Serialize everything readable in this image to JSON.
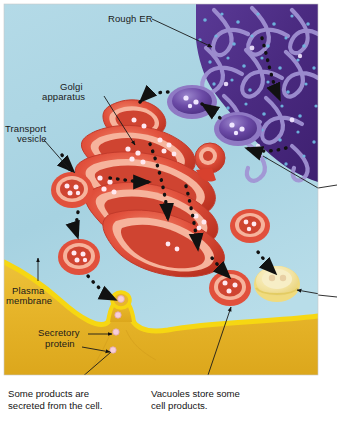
{
  "figure": {
    "canvas": {
      "width": 337,
      "height": 421
    },
    "art_frame": {
      "x": 4,
      "y": 4,
      "width": 314,
      "height": 371
    },
    "background_color": "#ffffff"
  },
  "palette": {
    "cytoplasm": "#a9d4e2",
    "cytoplasm_light": "#bcdeea",
    "rough_er_dark": "#4b2a82",
    "rough_er_mid": "#5d3a97",
    "rough_er_lumen": "#9f8fd0",
    "ribosome_dot": "#6fb7e0",
    "golgi_red": "#e1503c",
    "golgi_red_dark": "#c13a2b",
    "golgi_lumen": "#f6b39c",
    "vesicle_purple": "#6b4aa6",
    "vesicle_purple_rim": "#8f79c4",
    "vacuole_yellow": "#f2e2a0",
    "vacuole_rim": "#f6e27a",
    "membrane_line": "#f6d712",
    "cell_exterior": "#e8b62c",
    "cargo_dot": "#ffe6ef",
    "arrow_black": "#111111",
    "leader_line": "#1a1a1a",
    "label_text": "#1a1a1a"
  },
  "labels": [
    {
      "id": "rough-er",
      "text": "Rough ER",
      "x": 108,
      "y": 14,
      "align": "left"
    },
    {
      "id": "golgi-apparatus",
      "text": "Golgi",
      "x": 60,
      "y": 82,
      "align": "left"
    },
    {
      "id": "golgi-apparatus-2",
      "text": "apparatus",
      "x": 42,
      "y": 92,
      "align": "left"
    },
    {
      "id": "transport-vesicle",
      "text": "Transport",
      "x": 5,
      "y": 124,
      "align": "left"
    },
    {
      "id": "transport-vesicle-2",
      "text": "vesicle",
      "x": 17,
      "y": 134,
      "align": "left"
    },
    {
      "id": "plasma-membrane",
      "text": "Plasma",
      "x": 12,
      "y": 286,
      "align": "left"
    },
    {
      "id": "plasma-membrane-2",
      "text": "membrane",
      "x": 6,
      "y": 296,
      "align": "left"
    },
    {
      "id": "secretory-protein",
      "text": "Secretory",
      "x": 38,
      "y": 331,
      "align": "left"
    },
    {
      "id": "secretory-protein-2",
      "text": "protein",
      "x": 45,
      "y": 341,
      "align": "left"
    }
  ],
  "captions": [
    {
      "id": "caption-secretion",
      "line1": "Some products are",
      "line2": "secreted from the cell.",
      "x": 8,
      "y": 390
    },
    {
      "id": "caption-vacuoles",
      "line1": "Vacuoles store some",
      "line2": "cell products.",
      "x": 151,
      "y": 390
    }
  ],
  "structures": {
    "rough_er": {
      "name": "Rough ER",
      "region": "top-right",
      "ribosomes_visible": true
    },
    "golgi": {
      "name": "Golgi apparatus",
      "cisternae_count": 5,
      "region": "center-left"
    },
    "plasma_membrane": {
      "name": "Plasma membrane",
      "region": "bottom",
      "exocytosis_site_x": 123,
      "exocytosis_site_y": 318
    },
    "vacuole": {
      "name": "Vacuole",
      "color": "#f2e2a0",
      "x": 277,
      "y": 283
    },
    "secretory_vesicle": {
      "name": "Secretory vesicle",
      "color": "#e1503c",
      "x": 230,
      "y": 288
    }
  },
  "vesicles": [
    {
      "id": "er-vesicle-1",
      "type": "transport",
      "color": "purple",
      "cx": 192,
      "cy": 102,
      "rx": 25,
      "ry": 16,
      "cargo": 3
    },
    {
      "id": "er-vesicle-2",
      "type": "transport",
      "color": "purple",
      "cx": 238,
      "cy": 129,
      "rx": 24,
      "ry": 16,
      "cargo": 3
    },
    {
      "id": "golgi-vesicle-top",
      "type": "transport",
      "color": "red",
      "cx": 128,
      "cy": 114,
      "rx": 21,
      "ry": 16,
      "cargo": 3
    },
    {
      "id": "golgi-vesicle-left",
      "type": "transport",
      "color": "red",
      "cx": 72,
      "cy": 190,
      "rx": 20,
      "ry": 17,
      "cargo": 4
    },
    {
      "id": "secretory-vesicle-lower-left",
      "type": "secretory",
      "color": "red",
      "cx": 79,
      "cy": 257,
      "rx": 20,
      "ry": 17,
      "cargo": 4
    },
    {
      "id": "secretory-vesicle-right",
      "type": "secretory",
      "color": "red",
      "cx": 230,
      "cy": 288,
      "rx": 20,
      "ry": 17,
      "cargo": 3
    },
    {
      "id": "golgi-vesicle-right",
      "type": "transport",
      "color": "red",
      "cx": 250,
      "cy": 226,
      "rx": 19,
      "ry": 16,
      "cargo": 3
    },
    {
      "id": "vacuole",
      "type": "vacuole",
      "color": "yellow",
      "cx": 277,
      "cy": 283,
      "rx": 22,
      "ry": 17,
      "cargo": 2
    }
  ],
  "leader_lines": [
    {
      "id": "leader-rough-er",
      "from": [
        152,
        19
      ],
      "to": [
        212,
        47
      ],
      "arrow": true
    },
    {
      "id": "leader-golgi",
      "from": [
        104,
        96
      ],
      "to": [
        135,
        145
      ],
      "arrow": true
    },
    {
      "id": "leader-transport-vesicle",
      "from": [
        44,
        140
      ],
      "to": [
        72,
        172
      ],
      "arrow": true
    },
    {
      "id": "leader-plasma-membrane",
      "from": [
        38,
        280
      ],
      "to": [
        38,
        258
      ],
      "arrow": true
    },
    {
      "id": "leader-secretory-1",
      "from": [
        88,
        334
      ],
      "to": [
        114,
        334
      ],
      "arrow": true
    },
    {
      "id": "leader-secretory-2",
      "from": [
        82,
        346
      ],
      "to": [
        112,
        352
      ],
      "arrow": true
    },
    {
      "id": "leader-caption-secretion",
      "from": [
        74,
        386
      ],
      "to": [
        111,
        355
      ],
      "arrow": false
    },
    {
      "id": "leader-caption-vacuoles",
      "from": [
        205,
        386
      ],
      "to": [
        231,
        307
      ],
      "arrow": true
    },
    {
      "id": "leader-offpage-upper",
      "from": [
        318,
        188
      ],
      "to": [
        263,
        155
      ],
      "arrow": false
    },
    {
      "id": "leader-offpage-lower",
      "from": [
        337,
        297
      ],
      "to": [
        296,
        290
      ],
      "arrow": true
    }
  ],
  "flow_arrows": [
    {
      "id": "flow-er-to-vesicle-1",
      "path": "er-to-cytoplasm"
    },
    {
      "id": "flow-vesicle-to-golgi",
      "path": "vesicle-to-golgi-cis"
    },
    {
      "id": "flow-through-golgi",
      "path": "cis-to-trans"
    },
    {
      "id": "flow-golgi-to-membrane",
      "path": "trans-to-plasma-membrane"
    },
    {
      "id": "flow-golgi-to-vacuole",
      "path": "trans-to-vacuole"
    }
  ]
}
